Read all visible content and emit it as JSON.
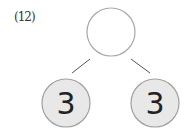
{
  "problem": {
    "label": "(12)",
    "top_node": {
      "value": ""
    },
    "left_node": {
      "value": "3"
    },
    "right_node": {
      "value": "3"
    }
  },
  "colors": {
    "node_fill_filled": "#e8e8e8",
    "node_fill_empty": "#ffffff",
    "node_stroke": "#a0a0a0",
    "line": "#555555"
  }
}
